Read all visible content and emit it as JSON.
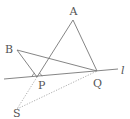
{
  "diagram": {
    "type": "geometry",
    "points": {
      "A": {
        "label": "A",
        "x": 73,
        "y": 20
      },
      "B": {
        "label": "B",
        "x": 17,
        "y": 50
      },
      "P": {
        "label": "P",
        "x": 37,
        "y": 77
      },
      "Q": {
        "label": "Q",
        "x": 97,
        "y": 71
      },
      "S": {
        "label": "S",
        "x": 17,
        "y": 109
      }
    },
    "line_l": {
      "label": "l"
    },
    "segments_solid": [
      "AP",
      "AQ",
      "BP",
      "BQ"
    ],
    "segments_dotted": [
      "PS",
      "SQ"
    ],
    "colors": {
      "line": "#777777",
      "dotted": "#999999",
      "text": "#555555"
    }
  }
}
